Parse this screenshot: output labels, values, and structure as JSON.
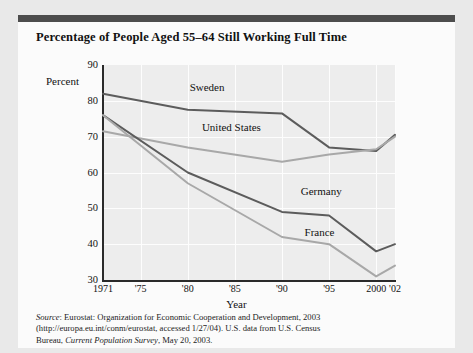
{
  "chart_title": "Percentage of People Aged 55–64 Still Working Full Time",
  "source_note": {
    "line1_label": "Source",
    "line1_rest": ": Eurostat: Organization for Economic Cooperation and Development, 2003",
    "line2": "(http://europa.eu.int/conm/eurostat, accessed 1/27/04). U.S. data from U.S. Census",
    "line3_pre": "Bureau, ",
    "line3_italic": "Current Population Survey",
    "line3_post": ", May 20, 2003."
  },
  "chart_data": {
    "type": "line",
    "title": "Percentage of People Aged 55–64 Still Working Full Time",
    "xlabel": "Year",
    "ylabel": "Percent",
    "ylim": [
      30,
      90
    ],
    "xlim": [
      1971,
      2002
    ],
    "ytick_labels": [
      "90",
      "80",
      "70",
      "60",
      "50",
      "40",
      "30"
    ],
    "ytick_values": [
      90,
      80,
      70,
      60,
      50,
      40,
      30
    ],
    "xtick_labels": [
      "1971",
      "'75",
      "'80",
      "'85",
      "'90",
      "'95",
      "2000",
      "'02"
    ],
    "xtick_values": [
      1971,
      1975,
      1980,
      1985,
      1990,
      1995,
      2000,
      2002
    ],
    "grid": true,
    "grid_color": "#fdfdfd",
    "legend": "inline-labels",
    "series": [
      {
        "name": "Sweden",
        "color": "#5c5c5c",
        "x": [
          1971,
          1980,
          1990,
          1995,
          2000,
          2002
        ],
        "values": [
          82,
          77.5,
          76.5,
          67,
          66,
          70.5
        ]
      },
      {
        "name": "United States",
        "color": "#a8a8a8",
        "x": [
          1971,
          1980,
          1990,
          1995,
          2000,
          2002
        ],
        "values": [
          71.5,
          67,
          63,
          65,
          66.5,
          70
        ]
      },
      {
        "name": "Germany",
        "color": "#5c5c5c",
        "x": [
          1971,
          1980,
          1990,
          1995,
          2000,
          2002
        ],
        "values": [
          76,
          60,
          49,
          48,
          38,
          40
        ]
      },
      {
        "name": "France",
        "color": "#a8a8a8",
        "x": [
          1971,
          1980,
          1990,
          1995,
          2000,
          2002
        ],
        "values": [
          76,
          57,
          42,
          40,
          31,
          34
        ]
      }
    ],
    "annotations": [
      {
        "text": "Sweden",
        "x": 1980.2,
        "y": 83.5
      },
      {
        "text": "United States",
        "x": 1981.5,
        "y": 72.5
      },
      {
        "text": "Germany",
        "x": 1992.0,
        "y": 54.5
      },
      {
        "text": "France",
        "x": 1992.4,
        "y": 43.0
      }
    ]
  }
}
